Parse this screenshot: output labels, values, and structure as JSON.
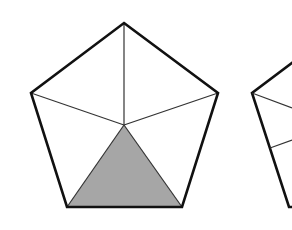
{
  "diagram": {
    "colors": {
      "stroke": "#111111",
      "shade": "#a6a6a6",
      "background": "#ffffff"
    },
    "pentagon_1": {
      "vertices": [
        [
          124,
          23
        ],
        [
          218,
          93
        ],
        [
          182,
          207
        ],
        [
          67,
          207
        ],
        [
          31,
          93
        ]
      ],
      "center": [
        124,
        125
      ],
      "shaded_triangle": [
        [
          124,
          125
        ],
        [
          182,
          207
        ],
        [
          67,
          207
        ]
      ]
    },
    "pentagon_2_partial": {
      "outline": [
        [
          292,
          63
        ],
        [
          252,
          93
        ],
        [
          289,
          207
        ],
        [
          292,
          207
        ]
      ],
      "inner_lines": [
        [
          [
            252,
            93
          ],
          [
            292,
            108
          ]
        ],
        [
          [
            270,
            148
          ],
          [
            292,
            140
          ]
        ]
      ]
    }
  }
}
